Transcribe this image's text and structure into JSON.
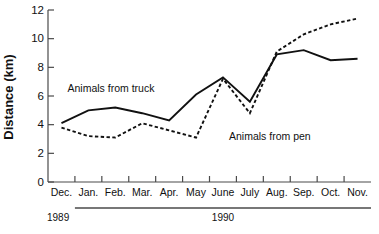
{
  "chart_data": {
    "type": "line",
    "title": "",
    "xlabel": "",
    "ylabel": "Distance (km)",
    "ylim": [
      0,
      12
    ],
    "yticks": [
      0,
      2,
      4,
      6,
      8,
      10,
      12
    ],
    "ytick_labels": [
      "0",
      "2",
      "4",
      "6",
      "8",
      "10",
      "12"
    ],
    "grid": false,
    "legend": "inline-annotations",
    "categories": [
      "Dec.",
      "Jan.",
      "Feb.",
      "Mar.",
      "Apr.",
      "May",
      "June",
      "July",
      "Aug.",
      "Sep.",
      "Oct.",
      "Nov."
    ],
    "series": [
      {
        "name": "Animals from truck",
        "style": "solid",
        "values": [
          4.1,
          5.0,
          5.2,
          4.8,
          4.3,
          6.1,
          7.3,
          5.6,
          8.9,
          9.2,
          8.5,
          8.6
        ]
      },
      {
        "name": "Animals from pen",
        "style": "dashed",
        "values": [
          3.8,
          3.2,
          3.1,
          4.1,
          3.6,
          3.1,
          7.2,
          4.8,
          9.1,
          10.3,
          11.0,
          11.4
        ]
      }
    ],
    "annotations": [
      {
        "text": "Animals from truck",
        "x_category": "Dec.",
        "y_value": 6.25
      },
      {
        "text": "Animals from pen",
        "x_category": "June",
        "y_value": 2.9
      }
    ],
    "year_bands": [
      {
        "label": "1989",
        "start_category": "Dec.",
        "end_category": "Dec."
      },
      {
        "label": "1990",
        "start_category": "Jan.",
        "end_category": "Nov."
      }
    ]
  }
}
